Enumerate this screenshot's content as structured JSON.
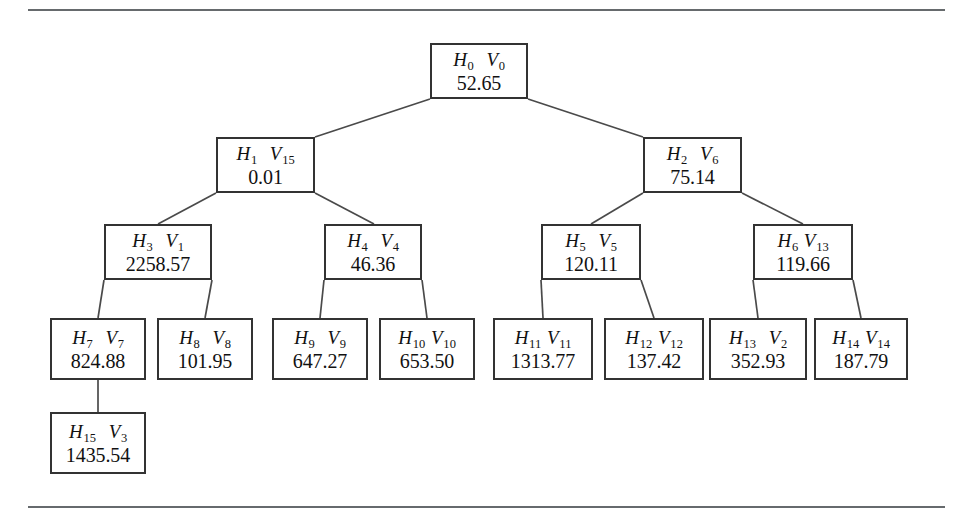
{
  "figure": {
    "type": "binary-tree-diagram",
    "rules": {
      "top": true,
      "bottom": true
    },
    "nodes": [
      {
        "id": "n0",
        "h": "H",
        "h_sub": "0",
        "v": "V",
        "v_sub": "0",
        "value": "52.65",
        "x": 430,
        "y": 43,
        "w": 98,
        "h_px": 56,
        "gap": "wide"
      },
      {
        "id": "n1",
        "h": "H",
        "h_sub": "1",
        "v": "V",
        "v_sub": "15",
        "value": "0.01",
        "x": 216,
        "y": 137,
        "w": 99,
        "h_px": 56,
        "gap": "wide"
      },
      {
        "id": "n2",
        "h": "H",
        "h_sub": "2",
        "v": "V",
        "v_sub": "6",
        "value": "75.14",
        "x": 643,
        "y": 137,
        "w": 99,
        "h_px": 56,
        "gap": "wide"
      },
      {
        "id": "n3",
        "h": "H",
        "h_sub": "3",
        "v": "V",
        "v_sub": "1",
        "value": "2258.57",
        "x": 104,
        "y": 224,
        "w": 108,
        "h_px": 56,
        "gap": "wide"
      },
      {
        "id": "n4",
        "h": "H",
        "h_sub": "4",
        "v": "V",
        "v_sub": "4",
        "value": "46.36",
        "x": 324,
        "y": 224,
        "w": 98,
        "h_px": 56,
        "gap": "wide"
      },
      {
        "id": "n5",
        "h": "H",
        "h_sub": "5",
        "v": "V",
        "v_sub": "5",
        "value": "120.11",
        "x": 541,
        "y": 224,
        "w": 100,
        "h_px": 56,
        "gap": "wide"
      },
      {
        "id": "n6",
        "h": "H",
        "h_sub": "6",
        "v": "V",
        "v_sub": "13",
        "value": "119.66",
        "x": 753,
        "y": 224,
        "w": 100,
        "h_px": 56,
        "gap": "tight"
      },
      {
        "id": "n7",
        "h": "H",
        "h_sub": "7",
        "v": "V",
        "v_sub": "7",
        "value": "824.88",
        "x": 50,
        "y": 318,
        "w": 96,
        "h_px": 62,
        "gap": "wide"
      },
      {
        "id": "n8",
        "h": "H",
        "h_sub": "8",
        "v": "V",
        "v_sub": "8",
        "value": "101.95",
        "x": 157,
        "y": 318,
        "w": 96,
        "h_px": 62,
        "gap": "wide"
      },
      {
        "id": "n9",
        "h": "H",
        "h_sub": "9",
        "v": "V",
        "v_sub": "9",
        "value": "647.27",
        "x": 272,
        "y": 318,
        "w": 96,
        "h_px": 62,
        "gap": "wide"
      },
      {
        "id": "n10",
        "h": "H",
        "h_sub": "10",
        "v": "V",
        "v_sub": "10",
        "value": "653.50",
        "x": 379,
        "y": 318,
        "w": 96,
        "h_px": 62,
        "gap": "tight"
      },
      {
        "id": "n11",
        "h": "H",
        "h_sub": "11",
        "v": "V",
        "v_sub": "11",
        "value": "1313.77",
        "x": 493,
        "y": 318,
        "w": 100,
        "h_px": 62,
        "gap": "tight"
      },
      {
        "id": "n12",
        "h": "H",
        "h_sub": "12",
        "v": "V",
        "v_sub": "12",
        "value": "137.42",
        "x": 604,
        "y": 318,
        "w": 100,
        "h_px": 62,
        "gap": "tight"
      },
      {
        "id": "n13",
        "h": "H",
        "h_sub": "13",
        "v": "V",
        "v_sub": "2",
        "value": "352.93",
        "x": 709,
        "y": 318,
        "w": 98,
        "h_px": 62,
        "gap": "wide"
      },
      {
        "id": "n14",
        "h": "H",
        "h_sub": "14",
        "v": "V",
        "v_sub": "14",
        "value": "187.79",
        "x": 814,
        "y": 318,
        "w": 94,
        "h_px": 62,
        "gap": "tight"
      },
      {
        "id": "n15",
        "h": "H",
        "h_sub": "15",
        "v": "V",
        "v_sub": "3",
        "value": "1435.54",
        "x": 50,
        "y": 412,
        "w": 96,
        "h_px": 62,
        "gap": "wide"
      }
    ],
    "edges": [
      {
        "from": "n0",
        "to": "n1",
        "x1": 430,
        "y1": 99,
        "x2": 315,
        "y2": 137
      },
      {
        "from": "n0",
        "to": "n2",
        "x1": 528,
        "y1": 99,
        "x2": 643,
        "y2": 137
      },
      {
        "from": "n1",
        "to": "n3",
        "x1": 216,
        "y1": 193,
        "x2": 158,
        "y2": 224
      },
      {
        "from": "n1",
        "to": "n4",
        "x1": 315,
        "y1": 193,
        "x2": 374,
        "y2": 224
      },
      {
        "from": "n2",
        "to": "n5",
        "x1": 643,
        "y1": 193,
        "x2": 591,
        "y2": 224
      },
      {
        "from": "n2",
        "to": "n6",
        "x1": 742,
        "y1": 193,
        "x2": 803,
        "y2": 224
      },
      {
        "from": "n3",
        "to": "n7",
        "x1": 104,
        "y1": 280,
        "x2": 98,
        "y2": 318
      },
      {
        "from": "n3",
        "to": "n8",
        "x1": 212,
        "y1": 280,
        "x2": 205,
        "y2": 318
      },
      {
        "from": "n4",
        "to": "n9",
        "x1": 324,
        "y1": 280,
        "x2": 320,
        "y2": 318
      },
      {
        "from": "n4",
        "to": "n10",
        "x1": 422,
        "y1": 280,
        "x2": 427,
        "y2": 318
      },
      {
        "from": "n5",
        "to": "n11",
        "x1": 541,
        "y1": 280,
        "x2": 543,
        "y2": 318
      },
      {
        "from": "n5",
        "to": "n12",
        "x1": 641,
        "y1": 280,
        "x2": 654,
        "y2": 318
      },
      {
        "from": "n6",
        "to": "n13",
        "x1": 753,
        "y1": 280,
        "x2": 758,
        "y2": 318
      },
      {
        "from": "n6",
        "to": "n14",
        "x1": 853,
        "y1": 280,
        "x2": 861,
        "y2": 318
      },
      {
        "from": "n7",
        "to": "n15",
        "x1": 98,
        "y1": 380,
        "x2": 98,
        "y2": 412
      }
    ]
  }
}
